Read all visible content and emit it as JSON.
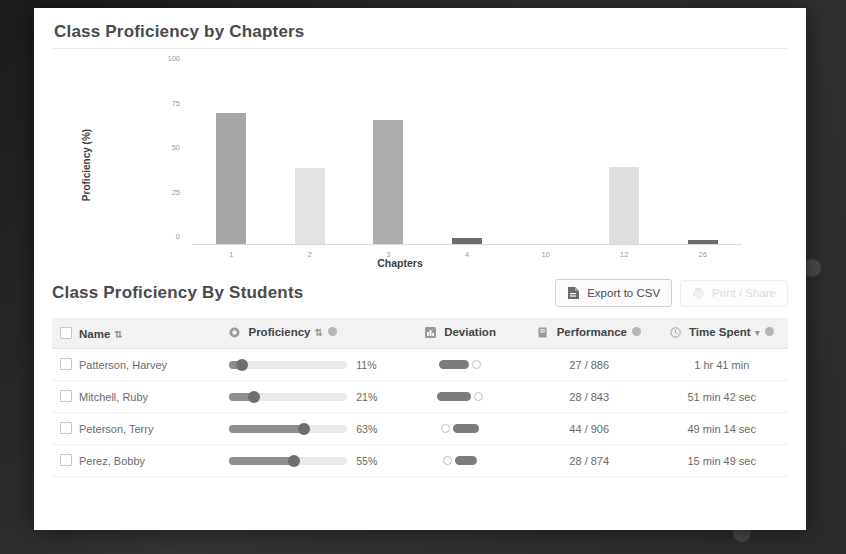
{
  "chart_card": {
    "title": "Class Proficiency by Chapters"
  },
  "chart_data": {
    "type": "bar",
    "title": "Class Proficiency by Chapters",
    "xlabel": "Chapters",
    "ylabel": "Proficiency (%)",
    "categories": [
      "1",
      "2",
      "3",
      "4",
      "10",
      "12",
      "26"
    ],
    "values": [
      74,
      43,
      70,
      4,
      0,
      44,
      3
    ],
    "colors": [
      "#a6a6a6",
      "#e2e2e2",
      "#aeaeae",
      "#6e6e6e",
      "#ffffff",
      "#dedede",
      "#6e6e6e"
    ],
    "ylim": [
      0,
      100
    ],
    "yticks": [
      "0",
      "25",
      "50",
      "75",
      "100"
    ],
    "grid": false,
    "legend": "none"
  },
  "students": {
    "title": "Class Proficiency By Students",
    "export_button": "Export to CSV",
    "export_icon": "file-csv-icon",
    "secondary_button": "Print / Share",
    "columns": [
      {
        "label": "Name",
        "icon": null,
        "sortable": true,
        "info": false
      },
      {
        "label": "Proficiency",
        "icon": "target-icon",
        "sortable": true,
        "info": true
      },
      {
        "label": "Deviation",
        "icon": "chart-icon",
        "sortable": false,
        "info": false
      },
      {
        "label": "Performance",
        "icon": "book-icon",
        "sortable": false,
        "info": true
      },
      {
        "label": "Time Spent",
        "icon": "clock-icon",
        "sortable": false,
        "info": true,
        "sort_active": true
      }
    ],
    "sort_glyph": "⇅",
    "sort_active_glyph": "▾",
    "rows": [
      {
        "name": "Patterson, Harvey",
        "proficiency_pct": "11%",
        "proficiency_value": 11,
        "deviation_value": 22,
        "deviation_side": "left",
        "performance": "27 / 886",
        "time_spent": "1 hr 41 min"
      },
      {
        "name": "Mitchell, Ruby",
        "proficiency_pct": "21%",
        "proficiency_value": 21,
        "deviation_value": 26,
        "deviation_side": "left",
        "performance": "28 / 843",
        "time_spent": "51 min 42 sec"
      },
      {
        "name": "Peterson, Terry",
        "proficiency_pct": "63%",
        "proficiency_value": 63,
        "deviation_value": 18,
        "deviation_side": "right",
        "performance": "44 / 906",
        "time_spent": "49 min 14 sec"
      },
      {
        "name": "Perez, Bobby",
        "proficiency_pct": "55%",
        "proficiency_value": 55,
        "deviation_value": 14,
        "deviation_side": "right",
        "performance": "28 / 874",
        "time_spent": "15 min 49 sec"
      }
    ]
  }
}
